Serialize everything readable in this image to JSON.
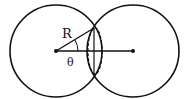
{
  "diagram": {
    "labels": {
      "radius": "R",
      "angle": "θ"
    },
    "colors": {
      "stroke": "#111111",
      "background": "#ffffff"
    },
    "geometry": {
      "left_circle": {
        "cx": 56,
        "cy": 51,
        "r": 46
      },
      "right_circle": {
        "cx": 133,
        "cy": 51,
        "r": 46
      },
      "intersection_top": {
        "x": 94,
        "y": 27
      },
      "intersection_bottom": {
        "x": 94,
        "y": 75
      },
      "dashed_ellipse": {
        "cx": 95,
        "cy": 51,
        "rx": 7,
        "ry": 23
      }
    }
  }
}
